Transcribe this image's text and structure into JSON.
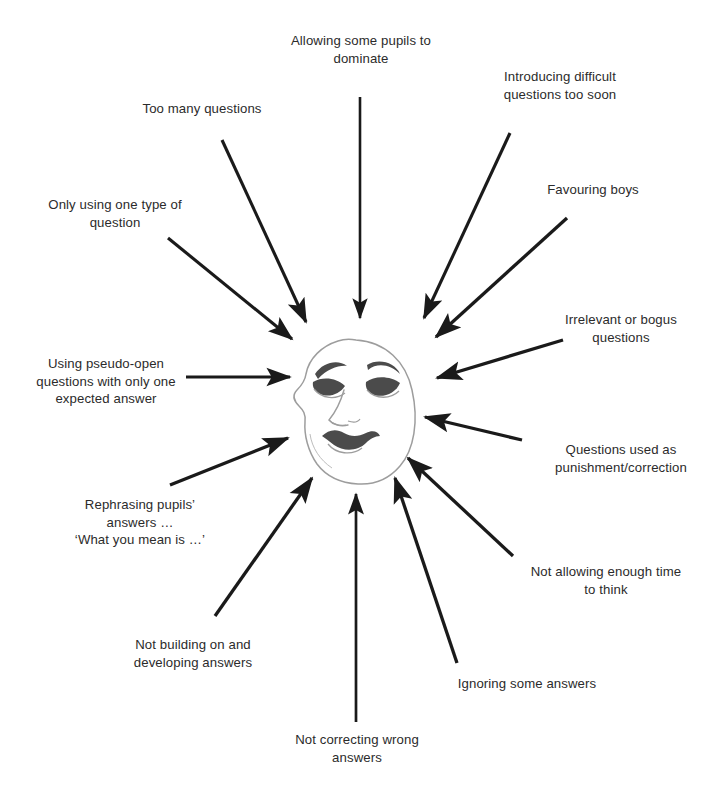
{
  "diagram": {
    "center": {
      "icon": "sad-theatre-mask",
      "description": "Sad theatre mask (tragedy mask) at the centre"
    },
    "colors": {
      "background": "#ffffff",
      "text": "#2b2b2b",
      "arrow": "#1a1a1a",
      "mask_outline": "#9a9a9a",
      "mask_feature": "#4a4a4a"
    },
    "labels": [
      {
        "id": "allowing-some-pupils-to-dominate",
        "text": "Allowing some pupils to\ndominate",
        "position": "top-center"
      },
      {
        "id": "introducing-difficult-questions-too-soon",
        "text": "Introducing difficult\nquestions too soon",
        "position": "top-right"
      },
      {
        "id": "favouring-boys",
        "text": "Favouring boys",
        "position": "upper-right"
      },
      {
        "id": "irrelevant-or-bogus-questions",
        "text": "Irrelevant or bogus\nquestions",
        "position": "right-upper"
      },
      {
        "id": "questions-used-as-punishment-correction",
        "text": "Questions used as\npunishment/correction",
        "position": "right-lower"
      },
      {
        "id": "not-allowing-enough-time-to-think",
        "text": "Not allowing enough time\nto think",
        "position": "lower-right"
      },
      {
        "id": "ignoring-some-answers",
        "text": "Ignoring some answers",
        "position": "bottom-right"
      },
      {
        "id": "not-correcting-wrong-answers",
        "text": "Not correcting wrong\nanswers",
        "position": "bottom-center"
      },
      {
        "id": "not-building-on-and-developing-answers",
        "text": "Not building on and\ndeveloping answers",
        "position": "bottom-left"
      },
      {
        "id": "rephrasing-pupils-answers",
        "text": "Rephrasing pupils’\nanswers …\n‘What you mean is …’",
        "position": "lower-left"
      },
      {
        "id": "using-pseudo-open-questions",
        "text": "Using pseudo-open\nquestions with only one\nexpected answer",
        "position": "left-middle"
      },
      {
        "id": "only-using-one-type-of-question",
        "text": "Only using one type of\nquestion",
        "position": "upper-left"
      },
      {
        "id": "too-many-questions",
        "text": "Too many questions",
        "position": "top-left"
      }
    ]
  }
}
